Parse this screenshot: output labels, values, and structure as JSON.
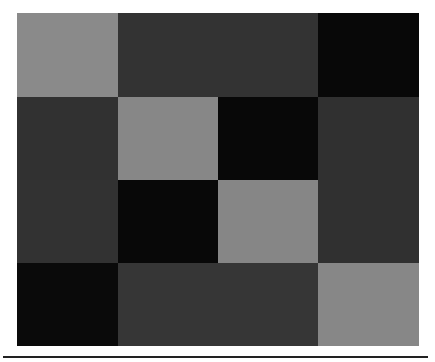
{
  "chart_data": {
    "type": "heatmap",
    "title": "",
    "xlabel": "",
    "ylabel": "",
    "rows": 4,
    "cols": 4,
    "colormap": "grayscale",
    "values": [
      [
        0.55,
        0.2,
        0.2,
        0.03
      ],
      [
        0.2,
        0.55,
        0.03,
        0.2
      ],
      [
        0.2,
        0.03,
        0.55,
        0.2
      ],
      [
        0.03,
        0.22,
        0.22,
        0.55
      ]
    ],
    "colors": [
      [
        "#8a8a8a",
        "#333333",
        "#333333",
        "#080808"
      ],
      [
        "#313131",
        "#878787",
        "#080808",
        "#303030"
      ],
      [
        "#323232",
        "#080808",
        "#868686",
        "#303030"
      ],
      [
        "#0a0a0a",
        "#363636",
        "#363636",
        "#878787"
      ]
    ],
    "grid": false,
    "legend": null
  }
}
